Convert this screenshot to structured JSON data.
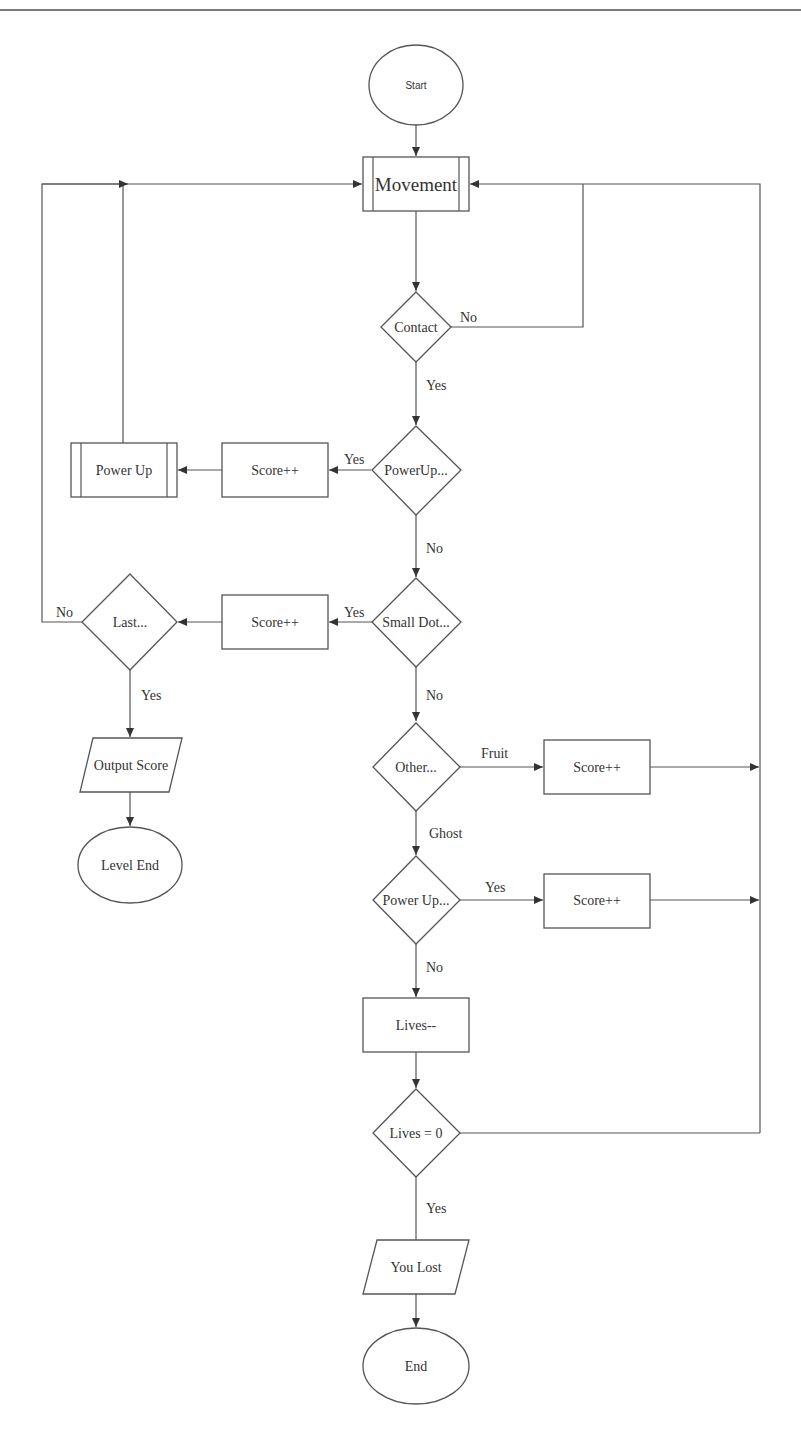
{
  "page": {
    "header_fragment": "g"
  },
  "nodes": {
    "start": "Start",
    "movement": "Movement",
    "contact": "Contact",
    "powerup_check": "PowerUp...",
    "score_powerup": "Score++",
    "power_up": "Power Up",
    "small_dot": "Small Dot...",
    "score_dot": "Score++",
    "last": "Last...",
    "output_score": "Output Score",
    "level_end": "Level End",
    "other": "Other...",
    "score_fruit": "Score++",
    "power_up_check2": "Power Up...",
    "score_ghost": "Score++",
    "lives_dec": "Lives--",
    "lives_zero": "Lives = 0",
    "you_lost": "You Lost",
    "end": "End"
  },
  "edges": {
    "contact_no": "No",
    "contact_yes": "Yes",
    "powerup_yes": "Yes",
    "powerup_no": "No",
    "smalldot_yes": "Yes",
    "smalldot_no": "No",
    "last_no": "No",
    "last_yes": "Yes",
    "other_fruit": "Fruit",
    "other_ghost": "Ghost",
    "powerup2_yes": "Yes",
    "powerup2_no": "No",
    "lives_yes": "Yes"
  },
  "colors": {
    "stroke": "#555555",
    "text": "#333333",
    "background": "#ffffff"
  }
}
